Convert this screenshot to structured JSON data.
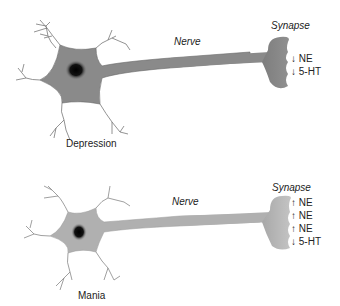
{
  "panels": [
    {
      "name": "depression",
      "caption": "Depression",
      "nerve_label": "Nerve",
      "synapse_label": "Synapse",
      "cell_color": "#8a8a8a",
      "neurotransmitters": [
        {
          "arrow": "↓",
          "label": "NE"
        },
        {
          "arrow": "↓",
          "label": "5-HT"
        }
      ]
    },
    {
      "name": "mania",
      "caption": "Mania",
      "nerve_label": "Nerve",
      "synapse_label": "Synapse",
      "cell_color": "#b0b0b0",
      "neurotransmitters": [
        {
          "arrow": "↑",
          "label": "NE"
        },
        {
          "arrow": "↑",
          "label": "NE"
        },
        {
          "arrow": "↑",
          "label": "NE"
        },
        {
          "arrow": "↓",
          "label": "5-HT"
        }
      ]
    }
  ]
}
